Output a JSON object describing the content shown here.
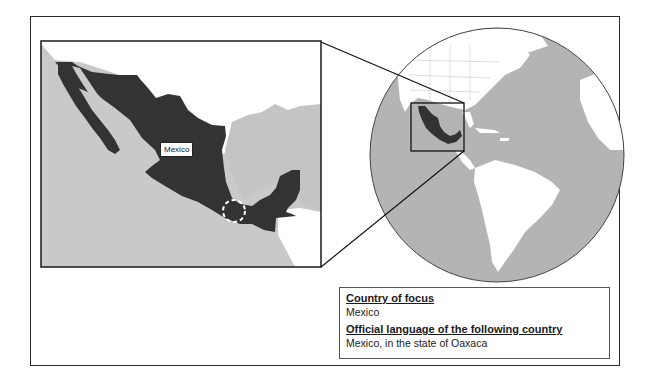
{
  "map": {
    "inset_label": "Mexico",
    "highlight_marker": "dashed-circle-oaxaca",
    "colors": {
      "country_fill": "#333333",
      "land_other": "#ffffff",
      "ocean": "#c8c8c8",
      "globe_ocean": "#b4b4b4",
      "frame": "#222222"
    }
  },
  "info": {
    "country_heading": "Country of focus",
    "country_value": "Mexico",
    "language_heading": "Official language of the following country",
    "language_value": "Mexico, in the state of Oaxaca"
  }
}
